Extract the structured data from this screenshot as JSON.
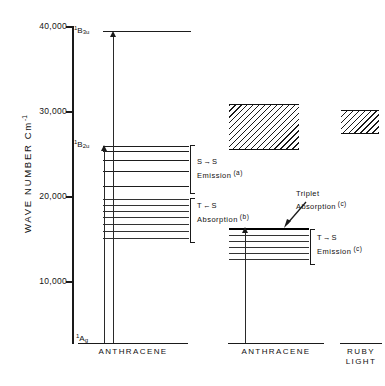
{
  "figure": {
    "axis": {
      "title": "WAVE NUMBER Cm",
      "title_exponent": "-1",
      "ticks": [
        {
          "label": "40,000",
          "value": 40000
        },
        {
          "label": "30,000",
          "value": 30000
        },
        {
          "label": "20,000",
          "value": 20000
        },
        {
          "label": "10,000",
          "value": 10000
        }
      ]
    },
    "columns": [
      {
        "id": "anthracene-left",
        "caption": "ANTHRACENE"
      },
      {
        "id": "anthracene-right",
        "caption": "ANTHRACENE"
      },
      {
        "id": "ruby-light",
        "caption": "RUBY\nLIGHT",
        "caption_line1": "RUBY",
        "caption_line2": "LIGHT"
      }
    ],
    "states": [
      {
        "id": "b3u",
        "prefix": "1",
        "letter": "B",
        "sub": "3u",
        "value": 37000
      },
      {
        "id": "b2u",
        "prefix": "1",
        "letter": "B",
        "sub": "2u",
        "value": 25000
      },
      {
        "id": "ag",
        "prefix": "1",
        "letter": "A",
        "sub": "g",
        "value": 0
      }
    ],
    "transitions": [
      {
        "id": "s-s-emission",
        "line1_left": "S",
        "line1_arrow": "→",
        "line1_right": "S",
        "line2": "Emission",
        "note": "(a)"
      },
      {
        "id": "t-s-absorption",
        "line1_left": "T",
        "line1_arrow": "←",
        "line1_right": "S",
        "line2": "Absorption",
        "note": "(b)"
      },
      {
        "id": "t-s-emission",
        "line1_left": "T",
        "line1_arrow": "→",
        "line1_right": "S",
        "line2": "Emission",
        "note": "(c)"
      }
    ],
    "callout": {
      "id": "triplet-absorption",
      "line1": "Triplet",
      "line2": "Absorption",
      "note": "(c)"
    },
    "bands": [
      {
        "id": "anthracene-triplet-band",
        "top_value": 30500,
        "bottom_value": 26000
      },
      {
        "id": "ruby-light-band",
        "top_value": 30000,
        "bottom_value": 27500
      }
    ]
  }
}
